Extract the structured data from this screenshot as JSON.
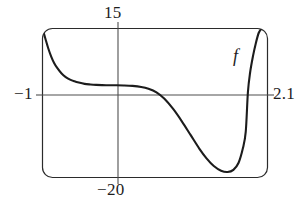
{
  "figure": {
    "caption_f": "f",
    "frame": {
      "style": "rounded-rectangle",
      "stroke_color": "#262626"
    },
    "axes": {
      "x_axis_label_left": "−1",
      "x_axis_label_right": "2.1",
      "y_axis_label_top": "15",
      "y_axis_label_bottom": "−20",
      "axis_color": "#4a4a4a"
    }
  },
  "chart_data": {
    "type": "line",
    "title": "",
    "xlabel": "",
    "ylabel": "",
    "xlim": [
      -1,
      2.1
    ],
    "ylim": [
      -20,
      15
    ],
    "grid": false,
    "legend": [
      "f"
    ],
    "legend_position": "inline-right",
    "annotations": [
      {
        "text": "f",
        "x": 1.72,
        "y": 8.2
      }
    ],
    "tick_labels": {
      "x": [
        "−1",
        "2.1"
      ],
      "y": [
        "15",
        "−20"
      ]
    },
    "axis_intercepts": {
      "x_axis_crossings": [
        0.57,
        1.83
      ],
      "plateau_y": 1.6,
      "minimum": {
        "x": 1.55,
        "y": -18.6
      }
    },
    "series": [
      {
        "name": "f",
        "color": "#1c1c1c",
        "x": [
          -1.0,
          -0.96,
          -0.92,
          -0.88,
          -0.84,
          -0.8,
          -0.74,
          -0.68,
          -0.62,
          -0.56,
          -0.5,
          -0.42,
          -0.34,
          -0.26,
          -0.18,
          -0.1,
          0.0,
          0.12,
          0.24,
          0.36,
          0.46,
          0.57,
          0.68,
          0.8,
          0.92,
          1.04,
          1.16,
          1.26,
          1.36,
          1.46,
          1.55,
          1.63,
          1.7,
          1.76,
          1.8,
          1.83,
          1.86,
          1.9,
          1.94,
          1.98,
          2.02
        ],
        "y": [
          15.0,
          12.6,
          10.3,
          8.4,
          6.9,
          5.8,
          4.5,
          3.6,
          3.0,
          2.6,
          2.3,
          2.0,
          1.85,
          1.75,
          1.7,
          1.68,
          1.66,
          1.62,
          1.52,
          1.28,
          0.85,
          0.0,
          -1.5,
          -3.9,
          -6.8,
          -10.0,
          -13.2,
          -15.5,
          -17.3,
          -18.4,
          -18.7,
          -18.2,
          -16.6,
          -13.2,
          -9.3,
          0.0,
          4.6,
          8.5,
          11.6,
          14.0,
          15.0
        ]
      }
    ]
  }
}
